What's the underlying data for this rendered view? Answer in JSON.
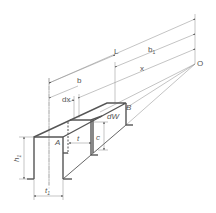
{
  "diagram": {
    "labels": {
      "L": "L",
      "b1": "b",
      "b1_sub": "1",
      "x": "x",
      "b": "b",
      "dx": "dx",
      "O": "O",
      "B": "B",
      "dW": "dW",
      "A": "A",
      "t": "t",
      "c": "c",
      "h1": "h",
      "h1_sub": "1",
      "t1": "t",
      "t1_sub": "1"
    },
    "colors": {
      "stroke": "#555555",
      "thin": "#888888",
      "background": "#ffffff"
    }
  }
}
